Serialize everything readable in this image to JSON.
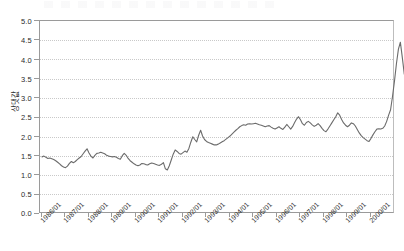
{
  "chart_data": {
    "type": "line",
    "title": "",
    "xlabel": "",
    "ylabel": "상댓값",
    "ylim": [
      0.0,
      5.0
    ],
    "ytick_step": 0.5,
    "ytick_labels": [
      "0.0",
      "0.5",
      "1.0",
      "1.5",
      "2.0",
      "2.5",
      "3.0",
      "3.5",
      "4.0",
      "4.5",
      "5.0"
    ],
    "grid": true,
    "grid_style": "dotted-horizontal",
    "legend": "none",
    "line_color": "#6b6b6b",
    "axis_color": "#9a9a9a",
    "x_tick_labels": [
      "1986/01",
      "1987/01",
      "1988/01",
      "1989/01",
      "1990/01",
      "1991/01",
      "1992/01",
      "1993/01",
      "1994/01",
      "1995/01",
      "1996/01",
      "1997/01",
      "1998/01",
      "1999/01",
      "2000/01"
    ],
    "x_range": [
      "1986/01",
      "2000/12"
    ],
    "x_frequency": "monthly",
    "series": [
      {
        "name": "상댓값",
        "values": [
          1.48,
          1.5,
          1.47,
          1.44,
          1.45,
          1.43,
          1.41,
          1.38,
          1.34,
          1.3,
          1.25,
          1.22,
          1.2,
          1.24,
          1.31,
          1.36,
          1.33,
          1.36,
          1.41,
          1.45,
          1.49,
          1.56,
          1.63,
          1.69,
          1.58,
          1.5,
          1.45,
          1.52,
          1.57,
          1.58,
          1.6,
          1.58,
          1.56,
          1.52,
          1.5,
          1.49,
          1.48,
          1.49,
          1.47,
          1.44,
          1.42,
          1.51,
          1.57,
          1.52,
          1.44,
          1.38,
          1.34,
          1.3,
          1.27,
          1.25,
          1.27,
          1.31,
          1.3,
          1.28,
          1.27,
          1.3,
          1.32,
          1.31,
          1.29,
          1.27,
          1.26,
          1.29,
          1.33,
          1.17,
          1.14,
          1.25,
          1.4,
          1.55,
          1.66,
          1.62,
          1.57,
          1.55,
          1.59,
          1.63,
          1.6,
          1.7,
          1.86,
          2.0,
          1.93,
          1.87,
          2.04,
          2.17,
          2.02,
          1.93,
          1.88,
          1.85,
          1.83,
          1.81,
          1.79,
          1.79,
          1.81,
          1.84,
          1.87,
          1.9,
          1.94,
          1.98,
          2.02,
          2.07,
          2.12,
          2.17,
          2.21,
          2.26,
          2.29,
          2.31,
          2.3,
          2.33,
          2.34,
          2.33,
          2.34,
          2.35,
          2.33,
          2.31,
          2.3,
          2.28,
          2.26,
          2.28,
          2.29,
          2.25,
          2.22,
          2.2,
          2.23,
          2.26,
          2.22,
          2.19,
          2.25,
          2.32,
          2.26,
          2.2,
          2.27,
          2.37,
          2.46,
          2.52,
          2.44,
          2.34,
          2.3,
          2.37,
          2.4,
          2.36,
          2.31,
          2.27,
          2.3,
          2.34,
          2.29,
          2.22,
          2.16,
          2.13,
          2.2,
          2.28,
          2.36,
          2.44,
          2.52,
          2.62,
          2.56,
          2.45,
          2.36,
          2.3,
          2.26,
          2.3,
          2.36,
          2.34,
          2.28,
          2.19,
          2.1,
          2.03,
          1.98,
          1.94,
          1.9,
          1.88,
          1.96,
          2.05,
          2.13,
          2.2,
          2.21,
          2.2,
          2.22,
          2.28,
          2.4,
          2.56,
          2.7,
          3.05,
          3.45,
          3.9,
          4.27,
          4.45,
          4.05,
          3.62,
          3.72,
          3.88,
          3.8,
          3.84,
          3.55,
          3.18,
          2.92,
          2.78
        ]
      }
    ]
  }
}
